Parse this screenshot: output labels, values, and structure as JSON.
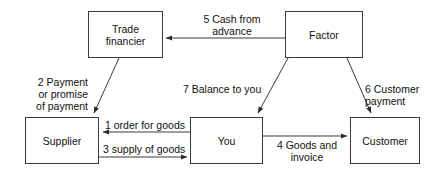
{
  "diagram": {
    "background_color": "#ffffff",
    "line_color": "#3a3a3a",
    "text_color": "#111111",
    "nodes": [
      {
        "id": "trade-financier",
        "label": "Trade\nfinancier",
        "x": 88,
        "y": 11,
        "w": 75,
        "h": 47
      },
      {
        "id": "factor",
        "label": "Factor",
        "x": 285,
        "y": 11,
        "w": 78,
        "h": 47
      },
      {
        "id": "supplier",
        "label": "Supplier",
        "x": 25,
        "y": 117,
        "w": 74,
        "h": 47
      },
      {
        "id": "you",
        "label": "You",
        "x": 190,
        "y": 117,
        "w": 73,
        "h": 47
      },
      {
        "id": "customer",
        "label": "Customer",
        "x": 350,
        "y": 117,
        "w": 70,
        "h": 47
      }
    ],
    "edges": [
      {
        "id": "edge-5",
        "label": "5 Cash from\nadvance",
        "from": "factor",
        "to": "trade-financier",
        "step": 5
      },
      {
        "id": "edge-2",
        "label": "2 Payment\nor promise\nof payment",
        "from": "trade-financier",
        "to": "supplier",
        "step": 2
      },
      {
        "id": "edge-7",
        "label": "7 Balance to you",
        "from": "factor",
        "to": "you",
        "step": 7
      },
      {
        "id": "edge-6",
        "label": "6 Customer\npayment",
        "from": "factor",
        "to": "customer",
        "step": 6
      },
      {
        "id": "edge-1",
        "label": "1 order for goods",
        "from": "you",
        "to": "supplier",
        "step": 1
      },
      {
        "id": "edge-3",
        "label": "3 supply of goods",
        "from": "supplier",
        "to": "you",
        "step": 3
      },
      {
        "id": "edge-4",
        "label": "4 Goods and\ninvoice",
        "from": "you",
        "to": "customer",
        "step": 4
      }
    ]
  }
}
